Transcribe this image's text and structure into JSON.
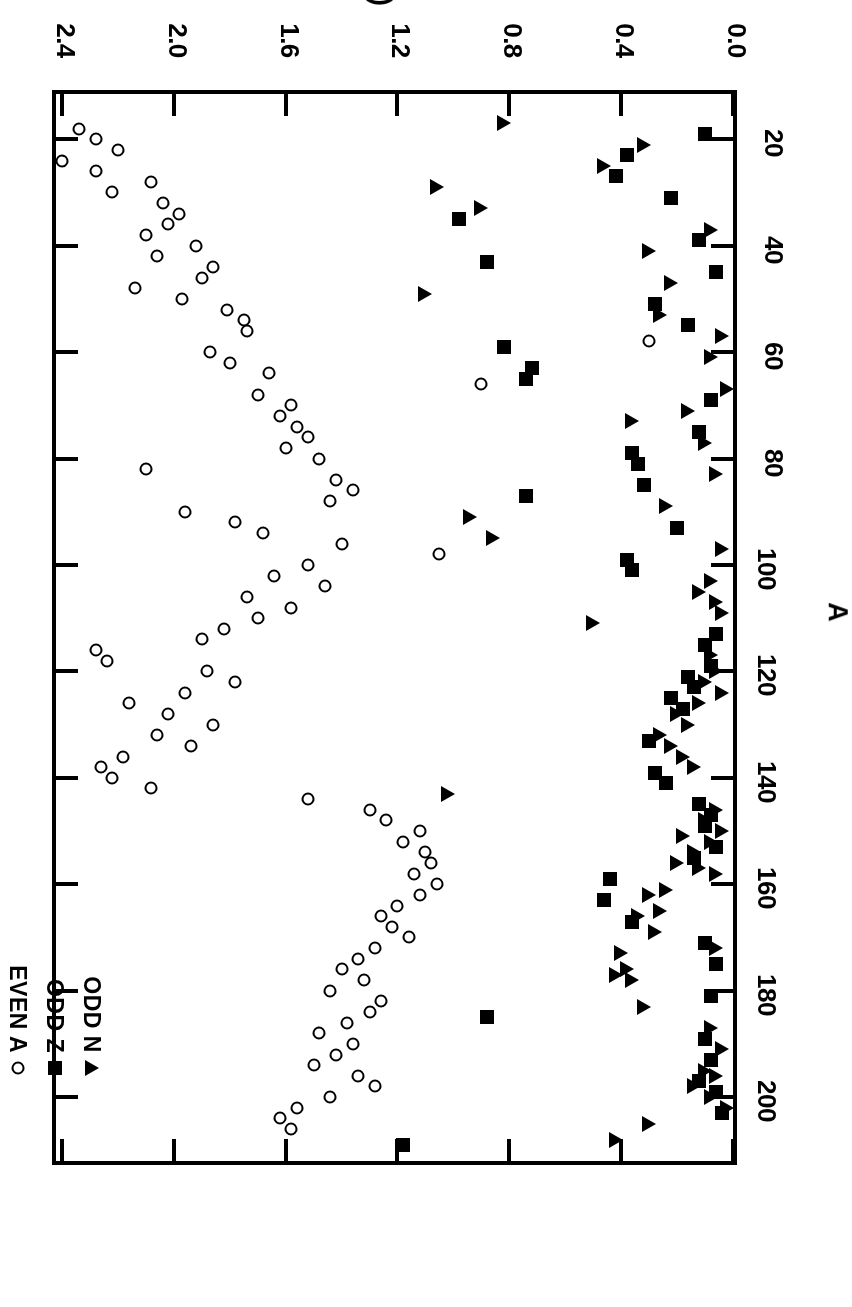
{
  "figure": {
    "orientation": "rotated-180",
    "background_color": "#ffffff",
    "ink_color": "#000000"
  },
  "legend": {
    "position": "upper-left-inside",
    "entries": [
      {
        "label": "EVEN A",
        "marker": "open-circle",
        "key": "even_a"
      },
      {
        "label": "ODD Z",
        "marker": "filled-square",
        "key": "odd_z"
      },
      {
        "label": "ODD N",
        "marker": "filled-triangle",
        "key": "odd_n"
      }
    ]
  },
  "chart_data": {
    "type": "scatter",
    "title": "",
    "xlabel": "A",
    "ylabel": "E (MeV)",
    "xlim": [
      10,
      212
    ],
    "ylim": [
      0.0,
      2.45
    ],
    "grid": false,
    "legend_position": "upper left",
    "xticks": [
      20,
      40,
      60,
      80,
      100,
      120,
      140,
      160,
      180,
      200
    ],
    "xticklabels": [
      "20",
      "40",
      "60",
      "80",
      "100",
      "120",
      "140",
      "160",
      "180",
      "200"
    ],
    "yticks": [
      0.0,
      0.4,
      0.8,
      1.2,
      1.6,
      2.0,
      2.4
    ],
    "yticklabels": [
      "0.0",
      "0.4",
      "0.8",
      "1.2",
      "1.6",
      "2.0",
      "2.4"
    ],
    "series": [
      {
        "name": "EVEN A",
        "marker": "open-circle",
        "color": "#000000",
        "points": [
          [
            18,
            2.34
          ],
          [
            20,
            2.28
          ],
          [
            22,
            2.2
          ],
          [
            24,
            2.4
          ],
          [
            26,
            2.28
          ],
          [
            28,
            2.08
          ],
          [
            30,
            2.22
          ],
          [
            32,
            2.04
          ],
          [
            34,
            1.98
          ],
          [
            36,
            2.02
          ],
          [
            38,
            2.1
          ],
          [
            40,
            1.92
          ],
          [
            42,
            2.06
          ],
          [
            44,
            1.86
          ],
          [
            46,
            1.9
          ],
          [
            48,
            2.14
          ],
          [
            50,
            1.97
          ],
          [
            52,
            1.81
          ],
          [
            54,
            1.75
          ],
          [
            56,
            1.74
          ],
          [
            58,
            0.3
          ],
          [
            60,
            1.87
          ],
          [
            62,
            1.8
          ],
          [
            64,
            1.66
          ],
          [
            66,
            0.9
          ],
          [
            68,
            1.7
          ],
          [
            70,
            1.58
          ],
          [
            72,
            1.62
          ],
          [
            74,
            1.56
          ],
          [
            76,
            1.52
          ],
          [
            78,
            1.6
          ],
          [
            80,
            1.48
          ],
          [
            82,
            2.1
          ],
          [
            84,
            1.42
          ],
          [
            86,
            1.36
          ],
          [
            88,
            1.44
          ],
          [
            90,
            1.96
          ],
          [
            92,
            1.78
          ],
          [
            94,
            1.68
          ],
          [
            96,
            1.4
          ],
          [
            98,
            1.05
          ],
          [
            100,
            1.52
          ],
          [
            102,
            1.64
          ],
          [
            104,
            1.46
          ],
          [
            106,
            1.74
          ],
          [
            108,
            1.58
          ],
          [
            110,
            1.7
          ],
          [
            112,
            1.82
          ],
          [
            114,
            1.9
          ],
          [
            116,
            2.28
          ],
          [
            118,
            2.24
          ],
          [
            120,
            1.88
          ],
          [
            122,
            1.78
          ],
          [
            124,
            1.96
          ],
          [
            126,
            2.16
          ],
          [
            128,
            2.02
          ],
          [
            130,
            1.86
          ],
          [
            132,
            2.06
          ],
          [
            134,
            1.94
          ],
          [
            136,
            2.18
          ],
          [
            138,
            2.26
          ],
          [
            140,
            2.22
          ],
          [
            142,
            2.08
          ],
          [
            144,
            1.52
          ],
          [
            146,
            1.3
          ],
          [
            148,
            1.24
          ],
          [
            150,
            1.12
          ],
          [
            152,
            1.18
          ],
          [
            154,
            1.1
          ],
          [
            156,
            1.08
          ],
          [
            158,
            1.14
          ],
          [
            160,
            1.06
          ],
          [
            162,
            1.12
          ],
          [
            164,
            1.2
          ],
          [
            166,
            1.26
          ],
          [
            168,
            1.22
          ],
          [
            170,
            1.16
          ],
          [
            172,
            1.28
          ],
          [
            174,
            1.34
          ],
          [
            176,
            1.4
          ],
          [
            178,
            1.32
          ],
          [
            180,
            1.44
          ],
          [
            182,
            1.26
          ],
          [
            184,
            1.3
          ],
          [
            186,
            1.38
          ],
          [
            188,
            1.48
          ],
          [
            190,
            1.36
          ],
          [
            192,
            1.42
          ],
          [
            194,
            1.5
          ],
          [
            196,
            1.34
          ],
          [
            198,
            1.28
          ],
          [
            200,
            1.44
          ],
          [
            202,
            1.56
          ],
          [
            204,
            1.62
          ],
          [
            206,
            1.58
          ]
        ]
      },
      {
        "name": "ODD Z",
        "marker": "filled-square",
        "color": "#000000",
        "points": [
          [
            19,
            0.1
          ],
          [
            23,
            0.38
          ],
          [
            27,
            0.42
          ],
          [
            31,
            0.22
          ],
          [
            35,
            0.98
          ],
          [
            39,
            0.12
          ],
          [
            43,
            0.88
          ],
          [
            45,
            0.06
          ],
          [
            51,
            0.28
          ],
          [
            55,
            0.16
          ],
          [
            59,
            0.82
          ],
          [
            63,
            0.72
          ],
          [
            65,
            0.74
          ],
          [
            69,
            0.08
          ],
          [
            75,
            0.12
          ],
          [
            79,
            0.36
          ],
          [
            81,
            0.34
          ],
          [
            85,
            0.32
          ],
          [
            87,
            0.74
          ],
          [
            93,
            0.2
          ],
          [
            99,
            0.38
          ],
          [
            101,
            0.36
          ],
          [
            113,
            0.06
          ],
          [
            115,
            0.1
          ],
          [
            119,
            0.08
          ],
          [
            121,
            0.16
          ],
          [
            123,
            0.14
          ],
          [
            125,
            0.22
          ],
          [
            127,
            0.18
          ],
          [
            133,
            0.3
          ],
          [
            139,
            0.28
          ],
          [
            141,
            0.24
          ],
          [
            145,
            0.12
          ],
          [
            147,
            0.08
          ],
          [
            149,
            0.1
          ],
          [
            153,
            0.06
          ],
          [
            155,
            0.14
          ],
          [
            159,
            0.44
          ],
          [
            163,
            0.46
          ],
          [
            167,
            0.36
          ],
          [
            171,
            0.1
          ],
          [
            175,
            0.06
          ],
          [
            181,
            0.08
          ],
          [
            185,
            0.88
          ],
          [
            189,
            0.1
          ],
          [
            193,
            0.08
          ],
          [
            197,
            0.12
          ],
          [
            199,
            0.06
          ],
          [
            203,
            0.04
          ],
          [
            209,
            1.18
          ]
        ]
      },
      {
        "name": "ODD N",
        "marker": "filled-triangle",
        "color": "#000000",
        "points": [
          [
            17,
            0.82
          ],
          [
            21,
            0.32
          ],
          [
            25,
            0.46
          ],
          [
            29,
            1.06
          ],
          [
            33,
            0.9
          ],
          [
            37,
            0.08
          ],
          [
            41,
            0.3
          ],
          [
            47,
            0.22
          ],
          [
            49,
            1.1
          ],
          [
            53,
            0.26
          ],
          [
            57,
            0.04
          ],
          [
            61,
            0.08
          ],
          [
            67,
            0.02
          ],
          [
            71,
            0.16
          ],
          [
            73,
            0.36
          ],
          [
            77,
            0.1
          ],
          [
            83,
            0.06
          ],
          [
            89,
            0.24
          ],
          [
            91,
            0.94
          ],
          [
            95,
            0.86
          ],
          [
            97,
            0.04
          ],
          [
            103,
            0.08
          ],
          [
            105,
            0.12
          ],
          [
            107,
            0.06
          ],
          [
            109,
            0.04
          ],
          [
            111,
            0.5
          ],
          [
            117,
            0.08
          ],
          [
            120,
            0.06
          ],
          [
            122,
            0.1
          ],
          [
            124,
            0.04
          ],
          [
            126,
            0.12
          ],
          [
            128,
            0.2
          ],
          [
            130,
            0.16
          ],
          [
            132,
            0.26
          ],
          [
            134,
            0.22
          ],
          [
            136,
            0.18
          ],
          [
            138,
            0.14
          ],
          [
            143,
            1.02
          ],
          [
            146,
            0.06
          ],
          [
            148,
            0.1
          ],
          [
            150,
            0.04
          ],
          [
            151,
            0.18
          ],
          [
            152,
            0.08
          ],
          [
            154,
            0.14
          ],
          [
            156,
            0.2
          ],
          [
            157,
            0.12
          ],
          [
            158,
            0.06
          ],
          [
            161,
            0.24
          ],
          [
            162,
            0.3
          ],
          [
            165,
            0.26
          ],
          [
            166,
            0.34
          ],
          [
            169,
            0.28
          ],
          [
            172,
            0.06
          ],
          [
            173,
            0.4
          ],
          [
            176,
            0.38
          ],
          [
            177,
            0.42
          ],
          [
            178,
            0.36
          ],
          [
            183,
            0.32
          ],
          [
            187,
            0.08
          ],
          [
            191,
            0.04
          ],
          [
            195,
            0.1
          ],
          [
            196,
            0.06
          ],
          [
            198,
            0.14
          ],
          [
            200,
            0.08
          ],
          [
            202,
            0.02
          ],
          [
            205,
            0.3
          ],
          [
            208,
            0.42
          ]
        ]
      }
    ]
  }
}
